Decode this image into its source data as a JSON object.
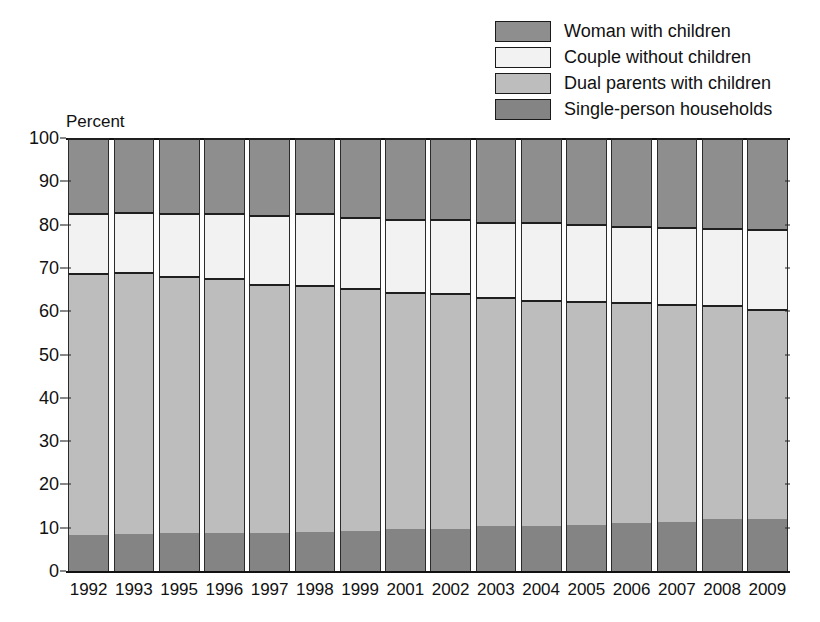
{
  "axis_title": "Percent",
  "legend": {
    "position": "top-right",
    "items": [
      {
        "label": "Woman with children",
        "color": "#8e8e8e",
        "key": "woman_with_children"
      },
      {
        "label": "Couple without children",
        "color": "#f2f2f2",
        "key": "couple_without_children"
      },
      {
        "label": "Dual parents with children",
        "color": "#bdbdbd",
        "key": "dual_parents_with_children"
      },
      {
        "label": "Single-person households",
        "color": "#848484",
        "key": "single_person_households"
      }
    ]
  },
  "chart_data": {
    "type": "bar",
    "subtype": "stacked-100-percent",
    "title": "",
    "xlabel": "",
    "ylabel": "Percent",
    "ylim": [
      0,
      100
    ],
    "yticks": [
      0,
      10,
      20,
      30,
      40,
      50,
      60,
      70,
      80,
      90,
      100
    ],
    "ytick_labels": [
      "0",
      "10",
      "20",
      "30",
      "40",
      "50",
      "60",
      "70",
      "80",
      "90",
      "100"
    ],
    "grid": false,
    "legend_position": "top-right",
    "categories": [
      "1992",
      "1993",
      "1995",
      "1996",
      "1997",
      "1998",
      "1999",
      "2001",
      "2002",
      "2003",
      "2004",
      "2005",
      "2006",
      "2007",
      "2008",
      "2009"
    ],
    "series": [
      {
        "name": "Single-person households",
        "color": "#848484",
        "values": [
          8.3,
          8.5,
          8.8,
          8.8,
          8.8,
          9.0,
          9.2,
          9.6,
          9.8,
          10.3,
          10.5,
          10.7,
          11.0,
          11.3,
          12.0,
          12.0
        ]
      },
      {
        "name": "Dual parents with children",
        "color": "#bdbdbd",
        "values": [
          60.5,
          60.5,
          59.4,
          58.8,
          57.6,
          57.0,
          56.1,
          54.8,
          54.4,
          53.0,
          52.2,
          51.6,
          51.1,
          50.4,
          49.4,
          48.6
        ]
      },
      {
        "name": "Couple without children",
        "color": "#f2f2f2",
        "values": [
          13.9,
          14.0,
          14.5,
          15.0,
          15.9,
          16.7,
          16.5,
          16.8,
          17.0,
          17.4,
          17.9,
          17.9,
          17.6,
          17.8,
          17.9,
          18.3
        ]
      },
      {
        "name": "Woman with children",
        "color": "#8e8e8e",
        "values": [
          17.3,
          17.0,
          17.3,
          17.4,
          17.7,
          17.3,
          18.2,
          18.8,
          18.8,
          19.3,
          19.4,
          19.8,
          20.3,
          20.5,
          20.7,
          21.1
        ]
      }
    ]
  }
}
